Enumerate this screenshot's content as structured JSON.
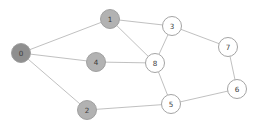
{
  "figure": {
    "type": "node-link-graph",
    "background_color": "#ffffff",
    "width": 257,
    "height": 128,
    "edge_color": "#b9b9b9",
    "node_stroke_color": "#9a9a9a",
    "label_color": "#3c3c3c",
    "node_radius": 9.5
  },
  "chart_data": {
    "type": "graph",
    "title": "",
    "xlabel": "",
    "ylabel": "",
    "directed": false,
    "node_count": 9,
    "edge_count": 12,
    "nodes": [
      {
        "id": "0",
        "label": "0",
        "x": 21,
        "y": 53,
        "fill": "#8f8f8f",
        "group": "dark"
      },
      {
        "id": "1",
        "label": "1",
        "x": 110,
        "y": 19,
        "fill": "#b2b2b2",
        "group": "shaded"
      },
      {
        "id": "2",
        "label": "2",
        "x": 87,
        "y": 110,
        "fill": "#b2b2b2",
        "group": "shaded"
      },
      {
        "id": "3",
        "label": "3",
        "x": 172,
        "y": 26,
        "fill": "#ffffff",
        "group": "plain"
      },
      {
        "id": "4",
        "label": "4",
        "x": 96,
        "y": 62,
        "fill": "#b2b2b2",
        "group": "shaded"
      },
      {
        "id": "5",
        "label": "5",
        "x": 171,
        "y": 104,
        "fill": "#ffffff",
        "group": "plain"
      },
      {
        "id": "6",
        "label": "6",
        "x": 237,
        "y": 89,
        "fill": "#ffffff",
        "group": "plain"
      },
      {
        "id": "7",
        "label": "7",
        "x": 228,
        "y": 47,
        "fill": "#ffffff",
        "group": "plain"
      },
      {
        "id": "8",
        "label": "8",
        "x": 155,
        "y": 63,
        "fill": "#ffffff",
        "group": "plain"
      }
    ],
    "edges": [
      {
        "source": "0",
        "target": "1"
      },
      {
        "source": "0",
        "target": "4"
      },
      {
        "source": "0",
        "target": "2"
      },
      {
        "source": "1",
        "target": "3"
      },
      {
        "source": "1",
        "target": "8"
      },
      {
        "source": "3",
        "target": "8"
      },
      {
        "source": "3",
        "target": "7"
      },
      {
        "source": "4",
        "target": "8"
      },
      {
        "source": "8",
        "target": "5"
      },
      {
        "source": "2",
        "target": "5"
      },
      {
        "source": "5",
        "target": "6"
      },
      {
        "source": "6",
        "target": "7"
      }
    ]
  }
}
